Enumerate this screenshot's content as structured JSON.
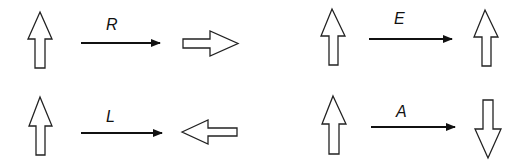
{
  "diagram": {
    "rows": [
      {
        "operation": "R",
        "input": "up-arrow",
        "output": "right-arrow"
      },
      {
        "operation": "E",
        "input": "up-arrow",
        "output": "up-arrow"
      },
      {
        "operation": "L",
        "input": "up-arrow",
        "output": "left-arrow"
      },
      {
        "operation": "A",
        "input": "up-arrow",
        "output": "down-arrow"
      }
    ]
  },
  "labels": {
    "r": "R",
    "e": "E",
    "l": "L",
    "a": "A"
  },
  "colors": {
    "stroke": "#222222",
    "fill": "#ffffff",
    "arrow": "#111111"
  }
}
